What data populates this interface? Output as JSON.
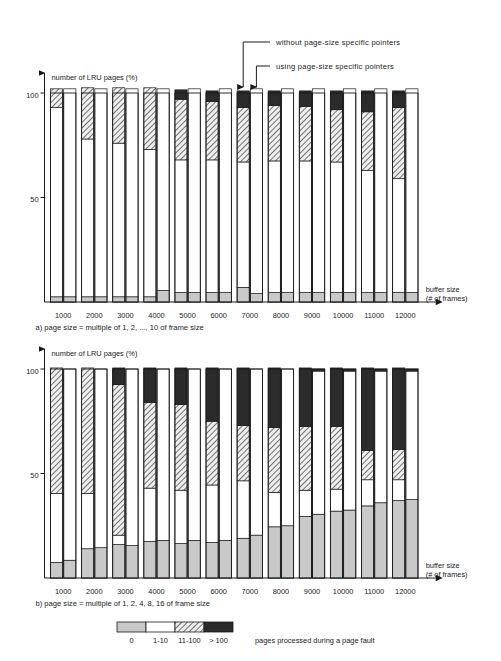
{
  "figure": {
    "title_axis_y": "number of LRU pages (%)",
    "title_axis_x_line1": "buffer size",
    "title_axis_x_line2": "(# of frames)",
    "annotation_upper": "without page-size specific pointers",
    "annotation_lower": "using page-size specific pointers",
    "caption_a": "a) page size = multiple of 1, 2, ..., 10 of frame size",
    "caption_b": "b) page size = multiple of 1, 2, 4, 8, 16 of frame size"
  },
  "legend": {
    "title": "pages processed during a page fault",
    "items": [
      {
        "label": "0",
        "color": "#c9c9c9",
        "pattern": "solid-gray"
      },
      {
        "label": "1-10",
        "color": "#ffffff",
        "pattern": "solid-white"
      },
      {
        "label": "11-100",
        "color": "#e8e8e8",
        "pattern": "diagonal-hatch"
      },
      {
        "label": "> 100",
        "color": "#2b2b2b",
        "pattern": "solid-dark"
      }
    ]
  },
  "colors": {
    "cat_0": "#c9c9c9",
    "cat_1_10": "#ffffff",
    "cat_11_100": "#e8e8e8",
    "cat_gt100": "#2b2b2b",
    "stroke": "#1a1a1a"
  },
  "chart_data": [
    {
      "id": "chart-a",
      "type": "bar",
      "subtype": "stacked-grouped",
      "title": "a) page size = multiple of 1, 2, ..., 10 of frame size",
      "xlabel": "buffer size (# of frames)",
      "ylabel": "number of LRU pages (%)",
      "ylim": [
        0,
        105
      ],
      "yticks": [
        50,
        100
      ],
      "ytick_labels": [
        "50",
        "100"
      ],
      "grid": false,
      "legend_position": "bottom-shared",
      "categories": [
        "1000",
        "2000",
        "3000",
        "4000",
        "5000",
        "6000",
        "7000",
        "8000",
        "9000",
        "10000",
        "11000",
        "12000"
      ],
      "stack_order": [
        "0",
        "1-10",
        "11-100",
        "> 100"
      ],
      "series": [
        {
          "name": "without page-size specific pointers",
          "group": "left",
          "stacks": {
            "0": [
              2.5,
              2.5,
              2.5,
              2.5,
              4.5,
              4.5,
              7.0,
              4.5,
              4.5,
              4.5,
              4.5,
              4.5
            ],
            "1-10": [
              90.5,
              75.5,
              73.5,
              70.5,
              63.5,
              63.5,
              60.0,
              63.0,
              63.0,
              62.5,
              58.5,
              54.5
            ],
            "11-100": [
              9.0,
              24.5,
              26.5,
              29.5,
              29.0,
              28.0,
              26.0,
              26.5,
              26.0,
              25.0,
              28.0,
              34.0
            ],
            "> 100": [
              0.0,
              0.0,
              0.0,
              0.0,
              4.5,
              5.0,
              8.0,
              7.0,
              7.5,
              9.0,
              10.0,
              8.0
            ]
          }
        },
        {
          "name": "using page-size specific pointers",
          "group": "right",
          "stacks": {
            "0": [
              2.5,
              2.5,
              2.5,
              5.5,
              4.5,
              4.5,
              4.0,
              4.5,
              4.5,
              4.5,
              4.5,
              4.5
            ],
            "1-10": [
              99.5,
              99.5,
              99.5,
              96.5,
              97.5,
              97.5,
              98.0,
              97.5,
              97.5,
              97.5,
              97.5,
              97.5
            ],
            "11-100": [
              0.0,
              0.0,
              0.0,
              0.0,
              0.0,
              0.0,
              0.0,
              0.0,
              0.0,
              0.0,
              0.0,
              0.0
            ],
            "> 100": [
              0.0,
              0.0,
              0.0,
              0.0,
              0.0,
              0.0,
              0.0,
              0.0,
              0.0,
              0.0,
              0.0,
              0.0
            ]
          }
        }
      ]
    },
    {
      "id": "chart-b",
      "type": "bar",
      "subtype": "stacked-grouped",
      "title": "b) page size = multiple of 1, 2, 4, 8, 16 of frame size",
      "xlabel": "buffer size (# of frames)",
      "ylabel": "number of LRU pages (%)",
      "ylim": [
        0,
        105
      ],
      "yticks": [
        50,
        100
      ],
      "ytick_labels": [
        "50",
        "100"
      ],
      "grid": false,
      "legend_position": "bottom-shared",
      "categories": [
        "1000",
        "2000",
        "3000",
        "4000",
        "5000",
        "6000",
        "7000",
        "8000",
        "9000",
        "10000",
        "11000",
        "12000"
      ],
      "stack_order": [
        "0",
        "1-10",
        "11-100",
        "> 100"
      ],
      "series": [
        {
          "name": "without page-size specific pointers",
          "group": "left",
          "stacks": {
            "0": [
              7.5,
              14.0,
              16.0,
              17.5,
              16.5,
              17.0,
              19.0,
              24.5,
              29.5,
              32.0,
              34.5,
              37.0
            ],
            "1-10": [
              33.0,
              26.5,
              4.5,
              25.5,
              25.5,
              27.5,
              27.5,
              16.5,
              12.5,
              10.5,
              12.5,
              10.0
            ],
            "11-100": [
              60.0,
              60.0,
              72.0,
              41.0,
              41.0,
              30.5,
              26.5,
              31.0,
              30.5,
              30.0,
              14.0,
              14.5
            ],
            "> 100": [
              0.0,
              0.0,
              8.0,
              16.5,
              17.5,
              25.5,
              27.5,
              28.5,
              28.0,
              28.0,
              39.5,
              39.0
            ]
          }
        },
        {
          "name": "using page-size specific pointers",
          "group": "right",
          "stacks": {
            "0": [
              8.5,
              14.5,
              15.5,
              18.0,
              18.0,
              18.0,
              20.5,
              25.0,
              30.5,
              32.5,
              36.0,
              37.5
            ],
            "1-10": [
              91.5,
              85.5,
              84.5,
              82.0,
              82.0,
              82.0,
              79.5,
              75.0,
              68.5,
              66.5,
              63.0,
              61.5
            ],
            "11-100": [
              0.0,
              0.0,
              0.0,
              0.0,
              0.0,
              0.0,
              0.0,
              0.0,
              0.0,
              0.0,
              0.0,
              0.0
            ],
            "> 100": [
              0.0,
              0.0,
              0.0,
              0.0,
              0.0,
              0.0,
              0.0,
              0.0,
              1.0,
              1.0,
              1.0,
              1.0
            ]
          }
        }
      ]
    }
  ]
}
